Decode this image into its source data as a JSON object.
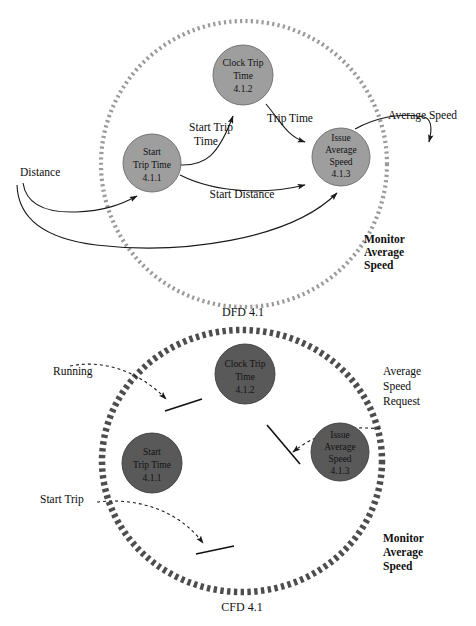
{
  "diagram": {
    "title_dfd": "DFD 4.1",
    "title_cfd": "CFD 4.1",
    "boundary_label_dfd": {
      "line1": "Monitor",
      "line2": "Average",
      "line3": "Speed"
    },
    "boundary_label_cfd": {
      "line1": "Monitor",
      "line2": "Average",
      "line3": "Speed"
    }
  },
  "dfd": {
    "processes": [
      {
        "id": "4.1.2",
        "name_line1": "Clock Trip",
        "name_line2": "Time",
        "number": "4.1.2"
      },
      {
        "id": "4.1.1",
        "name_line1": "Start",
        "name_line2": "Trip Time",
        "number": "4.1.1"
      },
      {
        "id": "4.1.3",
        "name_line1": "Issue",
        "name_line2": "Average",
        "name_line3": "Speed",
        "number": "4.1.3"
      }
    ],
    "flows": [
      {
        "id": "distance",
        "label": "Distance"
      },
      {
        "id": "start-trip-time",
        "label_line1": "Start Trip",
        "label_line2": "Time"
      },
      {
        "id": "trip-time",
        "label": "Trip Time"
      },
      {
        "id": "start-distance",
        "label": "Start Distance"
      },
      {
        "id": "average-speed",
        "label": "Average Speed"
      }
    ]
  },
  "cfd": {
    "processes": [
      {
        "id": "4.1.2",
        "name_line1": "Clock Trip",
        "name_line2": "Time",
        "number": "4.1.2"
      },
      {
        "id": "4.1.1",
        "name_line1": "Start",
        "name_line2": "Trip Time",
        "number": "4.1.1"
      },
      {
        "id": "4.1.3",
        "name_line1": "Issue",
        "name_line2": "Average",
        "name_line3": "Speed",
        "number": "4.1.3"
      }
    ],
    "flows": [
      {
        "id": "running",
        "label": "Running"
      },
      {
        "id": "start-trip",
        "label": "Start Trip"
      },
      {
        "id": "average-speed-request",
        "label_line1": "Average",
        "label_line2": "Speed",
        "label_line3": "Request"
      }
    ]
  },
  "colors": {
    "dfd_process_fill": "#9e9e9e",
    "cfd_process_fill": "#595959",
    "dfd_boundary": "#9a9a9a",
    "cfd_boundary": "#4d4d4d",
    "line": "#1a1a1a",
    "background": "#ffffff"
  }
}
